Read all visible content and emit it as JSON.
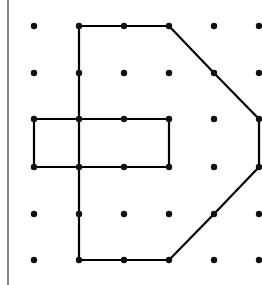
{
  "diagram": {
    "grid": {
      "columns": 6,
      "rows": 6
    },
    "colors": {
      "line": "#000000",
      "dot": "#111111",
      "background": "#ffffff",
      "border": "#333333"
    },
    "shapes": [
      {
        "name": "outer-polygon",
        "closed": true,
        "points": [
          [
            1,
            0
          ],
          [
            3,
            0
          ],
          [
            4,
            1
          ],
          [
            5,
            2
          ],
          [
            5,
            3
          ],
          [
            4,
            4
          ],
          [
            3,
            5
          ],
          [
            1,
            5
          ]
        ]
      },
      {
        "name": "rectangle",
        "closed": true,
        "points": [
          [
            0,
            2
          ],
          [
            3,
            2
          ],
          [
            3,
            3
          ],
          [
            0,
            3
          ]
        ]
      }
    ]
  }
}
